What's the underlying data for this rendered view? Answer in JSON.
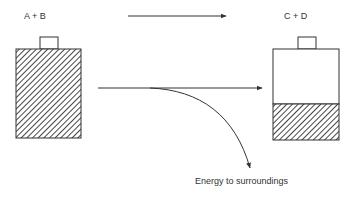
{
  "diagram": {
    "reactants_label": "A  +  B",
    "products_label": "C  +  D",
    "energy_label": "Energy to surroundings",
    "colors": {
      "stroke": "#333333",
      "background": "#ffffff"
    }
  }
}
